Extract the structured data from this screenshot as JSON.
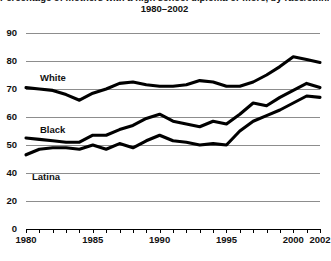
{
  "chart_data": {
    "type": "line",
    "title": "Percentage of mothers with a high school diploma or more, by race/ethnicity,",
    "subtitle": "1980–2002",
    "xlabel": "",
    "ylabel": "",
    "xlim": [
      1980,
      2002
    ],
    "ylim": [
      0,
      90
    ],
    "grid": true,
    "legend": "inline-labels",
    "ytick_labels": [
      "90",
      "80",
      "70",
      "60",
      "50",
      "40",
      "20",
      "0"
    ],
    "ytick_values": [
      90,
      80,
      70,
      60,
      50,
      40,
      20,
      0
    ],
    "xtick_labels": [
      "1980",
      "1985",
      "1990",
      "1995",
      "2000",
      "2002"
    ],
    "xtick_values": [
      1980,
      1985,
      1990,
      1995,
      2000,
      2002
    ],
    "x": [
      1980,
      1981,
      1982,
      1983,
      1984,
      1985,
      1986,
      1987,
      1988,
      1989,
      1990,
      1991,
      1992,
      1993,
      1994,
      1995,
      1996,
      1997,
      1998,
      1999,
      2000,
      2001,
      2002
    ],
    "series": [
      {
        "name": "White",
        "values": [
          70.5,
          70.0,
          69.5,
          68.0,
          66.0,
          68.5,
          70.0,
          72.0,
          72.5,
          71.5,
          71.0,
          71.0,
          71.5,
          73.0,
          72.5,
          71.0,
          71.0,
          72.5,
          75.0,
          78.0,
          81.5,
          80.5,
          79.5
        ]
      },
      {
        "name": "Black",
        "values": [
          52.5,
          52.0,
          51.5,
          51.0,
          51.0,
          53.5,
          53.5,
          55.5,
          57.0,
          59.5,
          61.0,
          58.5,
          57.5,
          56.5,
          58.5,
          57.5,
          61.0,
          65.0,
          64.0,
          67.0,
          69.5,
          72.0,
          70.5
        ]
      },
      {
        "name": "Latina",
        "values": [
          46.5,
          48.5,
          49.0,
          49.0,
          48.5,
          50.0,
          48.5,
          50.5,
          49.0,
          51.5,
          53.5,
          51.5,
          51.0,
          50.0,
          50.5,
          50.0,
          55.0,
          58.5,
          60.5,
          62.5,
          65.0,
          67.5,
          67.0
        ]
      }
    ]
  },
  "series_labels": {
    "white": "White",
    "black": "Black",
    "latina": "Latina"
  }
}
